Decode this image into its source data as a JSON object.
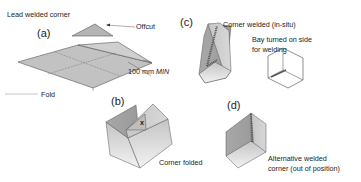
{
  "title": "Lead welded corner",
  "panels": {
    "a": {
      "label": "(a)",
      "offcut": "Offcut",
      "dimension": "100 mm",
      "dimension_suffix": "MIN",
      "fold": "Fold"
    },
    "b": {
      "label": "(b)",
      "marker": "x",
      "caption": "Corner folded"
    },
    "c": {
      "label": "(c)",
      "caption": "Corner welded (in-situ)",
      "note_line1": "Bay turned on side",
      "note_line2": "for welding"
    },
    "d": {
      "label": "(d)",
      "caption_line1": "Alternative welded",
      "caption_line2": "corner (out of position)"
    }
  },
  "colors": {
    "sheet_light": "#d6d6d6",
    "sheet_mid": "#b8b8b8",
    "sheet_dark": "#9c9c9c",
    "outline": "#444444",
    "text": "#222222"
  }
}
